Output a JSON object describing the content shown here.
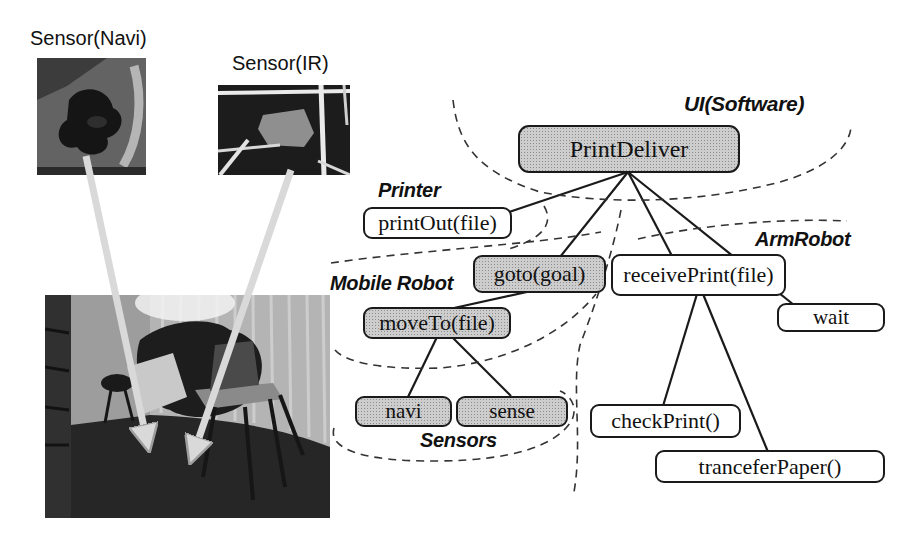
{
  "photos": {
    "navi_caption": "Sensor(Navi)",
    "ir_caption": "Sensor(IR)"
  },
  "groups": {
    "ui": "UI(Software)",
    "printer": "Printer",
    "mobile_robot": "Mobile Robot",
    "arm_robot": "ArmRobot",
    "sensors": "Sensors"
  },
  "nodes": {
    "print_deliver": "PrintDeliver",
    "print_out": "printOut(file)",
    "goto_goal": "goto(goal)",
    "receive_print": "receivePrint(file)",
    "wait": "wait",
    "move_to": "moveTo(file)",
    "navi": "navi",
    "sense": "sense",
    "check_print": "checkPrint()",
    "trancefer_paper": "tranceferPaper()"
  },
  "colors": {
    "shaded_box_fill": "#cdcdcd",
    "white_box_fill": "#ffffff",
    "box_border": "#1a1a1a",
    "connector_line": "#1a1a1a",
    "dashed_boundary": "#333333",
    "photo_arrow": "#d9d9d9"
  }
}
